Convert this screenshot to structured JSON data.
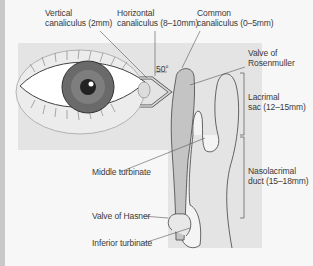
{
  "diagram": {
    "labels": {
      "vertical_canaliculus": "Vertical\ncanaliculus (2mm)",
      "horizontal_canaliculus": "Horizontal\ncanaliculus (8–10mm)",
      "common_canaliculus": "Common\ncanaliculus (0–5mm)",
      "angle": "50°",
      "valve_rosenmuller": "Valve of\nRosenmuller",
      "lacrimal_sac": "Lacrimal\nsac (12–15mm)",
      "nasolacrimal_duct": "Nasolacrimal\nduct (15–18mm)",
      "middle_turbinate": "Middle turbinate",
      "valve_hasner": "Valve of Hasner",
      "inferior_turbinate": "Inferior turbinate"
    },
    "colors": {
      "background": "#f7f7f7",
      "panel": "#e4e4e4",
      "sac": "#c4c4c4",
      "iris": "#6a6a6a",
      "outline": "#555555",
      "text": "#3a3a3a"
    }
  }
}
